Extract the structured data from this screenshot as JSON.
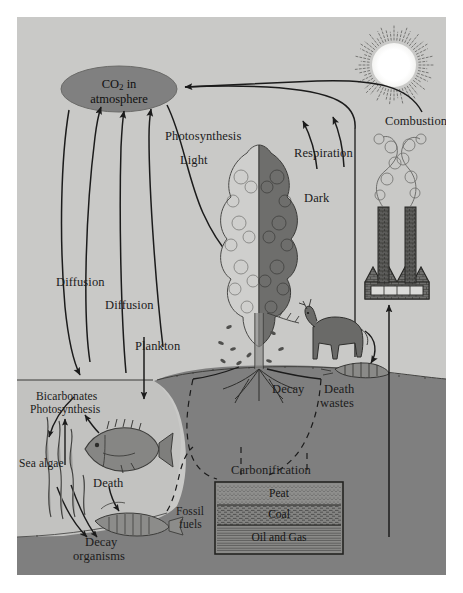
{
  "figure": {
    "background_color": "#c9c9c7",
    "land_color": "#7f7f7f",
    "ocean_color": "#c2c2c0",
    "ellipse_color": "#808080",
    "line_color": "#1b1b1b"
  },
  "atmosphere": {
    "co2_line1": "CO",
    "co2_sub": "2",
    "co2_line2": " in",
    "co2_line3": "atmosphere"
  },
  "labels": {
    "photosynthesis": "Photosynthesis",
    "light": "Light",
    "dark": "Dark",
    "respiration": "Respiration",
    "combustion": "Combustion",
    "diffusion_1": "Diffusion",
    "diffusion_2": "Diffusion",
    "plankton": "Plankton",
    "bicarbonates": "Bicarbonates",
    "photosynthesis_sea": "Photosynthesis",
    "sea_algae": "Sea algae",
    "death": "Death",
    "decay_organisms_l1": "Decay",
    "decay_organisms_l2": "organisms",
    "decay": "Decay",
    "death_wastes_l1": "Death",
    "death_wastes_l2": "wastes",
    "carbonification": "Carbonification",
    "fossil_fuels_l1": "Fossil",
    "fossil_fuels_l2": "fuels"
  },
  "fossil_fuel_layers": [
    {
      "name": "Peat"
    },
    {
      "name": "Coal"
    },
    {
      "name": "Oil and Gas"
    }
  ],
  "icons": {
    "sun": "sun-icon",
    "tree": "tree-icon",
    "deer": "deer-icon",
    "fish": "fish-icon",
    "algae": "seaweed-icon",
    "factory": "factory-icon",
    "smoke": "smoke-icon"
  }
}
